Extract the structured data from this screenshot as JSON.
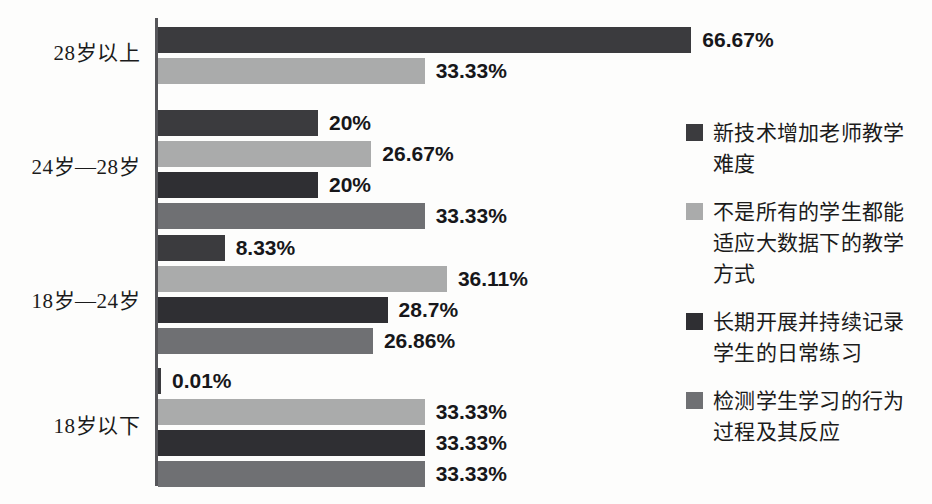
{
  "chart_data": {
    "type": "bar",
    "orientation": "horizontal",
    "title": "",
    "subtitle": "",
    "xlabel": "",
    "ylabel": "",
    "xlim": [
      0,
      70
    ],
    "grid": false,
    "legend_position": "right",
    "categories": [
      "28岁以上",
      "24岁—28岁",
      "18岁—24岁",
      "18岁以下"
    ],
    "series": [
      {
        "name": "新技术增加老师教学难度",
        "color": "#3b3b3e",
        "values": [
          66.67,
          20,
          8.33,
          0.01
        ],
        "labels": [
          "66.67%",
          "20%",
          "8.33%",
          "0.01%"
        ]
      },
      {
        "name": "不是所有的学生都能适应大数据下的教学方式",
        "color": "#aaabab",
        "values": [
          33.33,
          26.67,
          36.11,
          33.33
        ],
        "labels": [
          "33.33%",
          "26.67%",
          "36.11%",
          "33.33%"
        ]
      },
      {
        "name": "长期开展并持续记录学生的日常练习",
        "color": "#2f2f33",
        "values": [
          null,
          20,
          28.7,
          33.33
        ],
        "labels": [
          null,
          "20%",
          "28.7%",
          "33.33%"
        ]
      },
      {
        "name": "检测学生学习的行为过程及其反应",
        "color": "#6f7073",
        "values": [
          null,
          33.33,
          26.86,
          33.33
        ],
        "labels": [
          null,
          "33.33%",
          "26.86%",
          "33.33%"
        ]
      }
    ]
  },
  "axis": {
    "line_color": "#56565a"
  },
  "legend": {
    "items": [
      {
        "label": "新技术增加老师教学\n难度",
        "color": "#3b3b3e"
      },
      {
        "label": "不是所有的学生都能\n适应大数据下的教学\n方式",
        "color": "#aaabab"
      },
      {
        "label": "长期开展并持续记录\n学生的日常练习",
        "color": "#2f2f33"
      },
      {
        "label": "检测学生学习的行为\n过程及其反应",
        "color": "#6f7073"
      }
    ]
  },
  "groups": [
    {
      "label": "28岁以上",
      "label_top": 36,
      "top": 27,
      "bars": [
        {
          "series": 0,
          "value": 66.67,
          "label": "66.67%",
          "color": "#3b3b3e",
          "top": 0
        },
        {
          "series": 1,
          "value": 33.33,
          "label": "33.33%",
          "color": "#aaabab",
          "top": 31
        }
      ]
    },
    {
      "label": "24岁—28岁",
      "label_top": 150,
      "top": 110,
      "bars": [
        {
          "series": 0,
          "value": 20,
          "label": "20%",
          "color": "#3b3b3e",
          "top": 0
        },
        {
          "series": 1,
          "value": 26.67,
          "label": "26.67%",
          "color": "#aaabab",
          "top": 31
        },
        {
          "series": 2,
          "value": 20,
          "label": "20%",
          "color": "#2f2f33",
          "top": 62
        },
        {
          "series": 3,
          "value": 33.33,
          "label": "33.33%",
          "color": "#6f7073",
          "top": 93
        }
      ]
    },
    {
      "label": "18岁—24岁",
      "label_top": 284,
      "top": 235,
      "bars": [
        {
          "series": 0,
          "value": 8.33,
          "label": "8.33%",
          "color": "#3b3b3e",
          "top": 0
        },
        {
          "series": 1,
          "value": 36.11,
          "label": "36.11%",
          "color": "#aaabab",
          "top": 31
        },
        {
          "series": 2,
          "value": 28.7,
          "label": "28.7%",
          "color": "#2f2f33",
          "top": 62
        },
        {
          "series": 3,
          "value": 26.86,
          "label": "26.86%",
          "color": "#6f7073",
          "top": 93
        }
      ]
    },
    {
      "label": "18岁以下",
      "label_top": 409,
      "top": 368,
      "bars": [
        {
          "series": 0,
          "value": 0.01,
          "label": "0.01%",
          "color": "#3b3b3e",
          "top": 0
        },
        {
          "series": 1,
          "value": 33.33,
          "label": "33.33%",
          "color": "#aaabab",
          "top": 31
        },
        {
          "series": 2,
          "value": 33.33,
          "label": "33.33%",
          "color": "#2f2f33",
          "top": 62
        },
        {
          "series": 3,
          "value": 33.33,
          "label": "33.33%",
          "color": "#6f7073",
          "top": 93
        }
      ]
    }
  ],
  "scale": {
    "px_per_percent": 8.0,
    "min_bar_px": 3
  }
}
